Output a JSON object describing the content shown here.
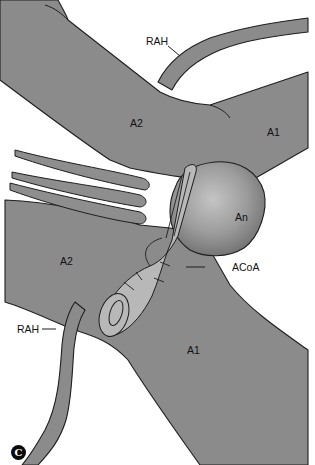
{
  "figure": {
    "panel_letter": "C",
    "labels": {
      "rah_top": "RAH",
      "a2_top": "A2",
      "a1_top": "A1",
      "aneurysm": "An",
      "a2_left": "A2",
      "acoa": "ACoA",
      "rah_bottom": "RAH",
      "a1_bottom": "A1"
    },
    "colors": {
      "vessel": "#8b8b8b",
      "aneurysm": "#9a9a9a",
      "clip": "#b8b8b8",
      "outline": "#1e1e1e",
      "background": "#ffffff"
    }
  }
}
